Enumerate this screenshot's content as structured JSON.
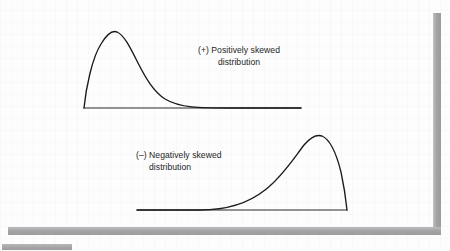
{
  "figure": {
    "background_color": "#fdfdfd",
    "curve_color": "#1a1a1a",
    "axis_color": "#2a2a2a",
    "text_color": "#1d1d1d",
    "scan_artifact_color": "#a9a9ab"
  },
  "captions": {
    "positive": {
      "line1": "(+) Positively skewed",
      "line2": "distribution"
    },
    "negative": {
      "line1": "(–) Negatively skewed",
      "line2": "distribution"
    }
  },
  "chart_data": {
    "type": "line",
    "title": "",
    "xlabel": "",
    "ylabel": "",
    "grid": false,
    "legend_position": "inline-annotation",
    "series": [
      {
        "name": "(+) Positively skewed distribution",
        "skew": "positive",
        "baseline_y": 108,
        "axis_x_start": 84,
        "axis_x_end": 301,
        "peak": {
          "x": 113,
          "y": 31
        },
        "path": "M 84 108 C 86 88 92 58 101 44 C 107 34 112 30 117 32 C 124 35 130 47 137 61 C 146 79 154 92 165 99 C 180 108 200 108 230 108 L 301 108",
        "points": [
          {
            "x": 84,
            "y": 108
          },
          {
            "x": 95,
            "y": 52
          },
          {
            "x": 105,
            "y": 37
          },
          {
            "x": 113,
            "y": 31
          },
          {
            "x": 122,
            "y": 37
          },
          {
            "x": 134,
            "y": 54
          },
          {
            "x": 148,
            "y": 74
          },
          {
            "x": 163,
            "y": 90
          },
          {
            "x": 182,
            "y": 100
          },
          {
            "x": 205,
            "y": 105
          },
          {
            "x": 235,
            "y": 107
          },
          {
            "x": 270,
            "y": 108
          },
          {
            "x": 301,
            "y": 108
          }
        ]
      },
      {
        "name": "(–) Negatively skewed distribution",
        "skew": "negative",
        "baseline_y": 210,
        "axis_x_start": 137,
        "axis_x_end": 347,
        "peak": {
          "x": 313,
          "y": 135
        },
        "path": "M 137 210 L 200 210 C 230 210 250 202 265 190 C 282 177 294 158 304 145 C 310 138 316 134 322 136 C 329 139 336 152 341 172 C 344 186 346 200 347 210",
        "points": [
          {
            "x": 137,
            "y": 210
          },
          {
            "x": 175,
            "y": 210
          },
          {
            "x": 205,
            "y": 208
          },
          {
            "x": 232,
            "y": 201
          },
          {
            "x": 258,
            "y": 190
          },
          {
            "x": 280,
            "y": 172
          },
          {
            "x": 297,
            "y": 152
          },
          {
            "x": 308,
            "y": 139
          },
          {
            "x": 317,
            "y": 135
          },
          {
            "x": 327,
            "y": 143
          },
          {
            "x": 337,
            "y": 166
          },
          {
            "x": 344,
            "y": 192
          },
          {
            "x": 347,
            "y": 210
          }
        ]
      }
    ]
  }
}
